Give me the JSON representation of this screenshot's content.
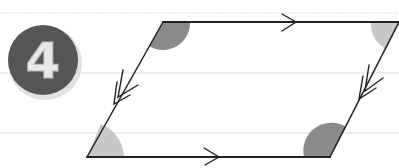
{
  "badge": {
    "number": "4",
    "fill_color": "#555555",
    "text_color": "#e8e8e8"
  },
  "diagram": {
    "shape": "parallelogram",
    "parallel_marks": {
      "top_bottom": "single-arrow",
      "left_right": "double-arrow"
    },
    "angles": [
      {
        "vertex": "top-left",
        "shade": "dark",
        "color": "#8a8a8a"
      },
      {
        "vertex": "top-right",
        "shade": "light",
        "color": "#c8c8c8"
      },
      {
        "vertex": "bottom-left",
        "shade": "light",
        "color": "#c8c8c8"
      },
      {
        "vertex": "bottom-right",
        "shade": "dark",
        "color": "#8a8a8a"
      }
    ],
    "line_color": "#222222",
    "ruled_line_color": "#d8d8d8"
  }
}
